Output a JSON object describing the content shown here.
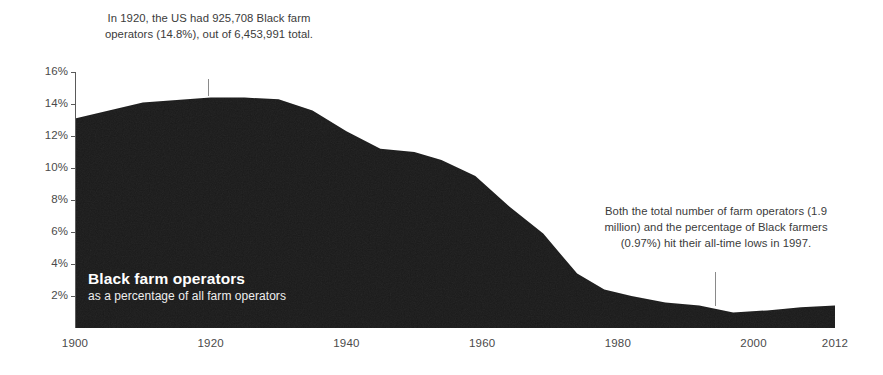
{
  "chart_data": {
    "type": "area",
    "title": "Black farm operators",
    "subtitle": "as a percentage of all farm operators",
    "xlabel": "",
    "ylabel": "",
    "xlim": [
      1900,
      2012
    ],
    "ylim": [
      0,
      16.8
    ],
    "grid": false,
    "legend": "none",
    "series_color": "#1a1a1a",
    "background_color": "#ffffff",
    "x_ticks": [
      "1900",
      "1920",
      "1940",
      "1960",
      "1980",
      "2000",
      "2012"
    ],
    "x_tick_values": [
      1900,
      1920,
      1940,
      1960,
      1980,
      2000,
      2012
    ],
    "y_ticks": [
      "16%",
      "14%",
      "12%",
      "10%",
      "8%",
      "6%",
      "4%",
      "2%"
    ],
    "y_tick_values": [
      16,
      14,
      12,
      10,
      8,
      6,
      4,
      2
    ],
    "x": [
      1900,
      1910,
      1920,
      1925,
      1930,
      1935,
      1940,
      1945,
      1950,
      1954,
      1959,
      1964,
      1969,
      1974,
      1978,
      1982,
      1987,
      1992,
      1997,
      2002,
      2007,
      2012
    ],
    "values": [
      13.1,
      14.1,
      14.4,
      14.4,
      14.3,
      13.6,
      12.3,
      11.2,
      11.0,
      10.5,
      9.5,
      7.6,
      5.9,
      3.4,
      2.4,
      2.0,
      1.6,
      1.4,
      0.97,
      1.1,
      1.3,
      1.4
    ],
    "annotations": [
      {
        "id": "annotation-1920",
        "text": "In 1920, the US had 925,708 Black farm operators (14.8%), out of 6,453,991 total.",
        "target_x": 1920,
        "target_y": 14.4
      },
      {
        "id": "annotation-1997",
        "text": "Both the total number of farm operators (1.9 million) and the percentage of Black farmers (0.97%) hit their all-time lows in 1997.",
        "target_x": 1997,
        "target_y": 0.97
      }
    ]
  },
  "axis": {
    "y_ticks": [
      "16%",
      "14%",
      "12%",
      "10%",
      "8%",
      "6%",
      "4%",
      "2%"
    ],
    "x_ticks": [
      "1900",
      "1920",
      "1940",
      "1960",
      "1980",
      "2000",
      "2012"
    ]
  },
  "series_label": {
    "title": "Black farm operators",
    "subtitle": "as a percentage of all farm operators"
  },
  "annotations": {
    "first": "In 1920, the US had 925,708 Black farm operators (14.8%), out of 6,453,991 total.",
    "second": "Both the total number of farm operators (1.9 million) and the percentage of Black farmers (0.97%) hit their all-time lows in 1997."
  }
}
